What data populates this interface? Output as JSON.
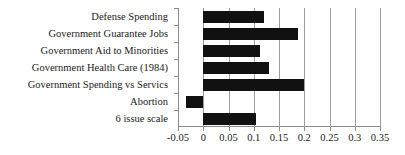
{
  "chart_data": {
    "type": "bar",
    "orientation": "horizontal",
    "title": "",
    "xlabel": "",
    "ylabel": "",
    "categories": [
      "Defense Spending",
      "Government Guarantee Jobs",
      "Government Aid to Minorities",
      "Government Health Care (1984)",
      "Government Spending vs Servics",
      "Abortion",
      "6 issue scale"
    ],
    "values": [
      0.12,
      0.188,
      0.113,
      0.13,
      0.2,
      -0.035,
      0.105
    ],
    "xlim": [
      -0.05,
      0.35
    ],
    "xticks": [
      -0.05,
      0,
      0.05,
      0.1,
      0.15,
      0.2,
      0.25,
      0.3,
      0.35
    ],
    "xtick_labels": [
      "-0.05",
      "0",
      "0.05",
      "0.1",
      "0.15",
      "0.2",
      "0.25",
      "0.3",
      "0.35"
    ],
    "grid": true,
    "grid_axis": "x",
    "legend": false,
    "bar_color": "#111111",
    "grid_color": "#9d9d9d",
    "axis_color": "#8a8a8a",
    "background": "#ffffff"
  }
}
